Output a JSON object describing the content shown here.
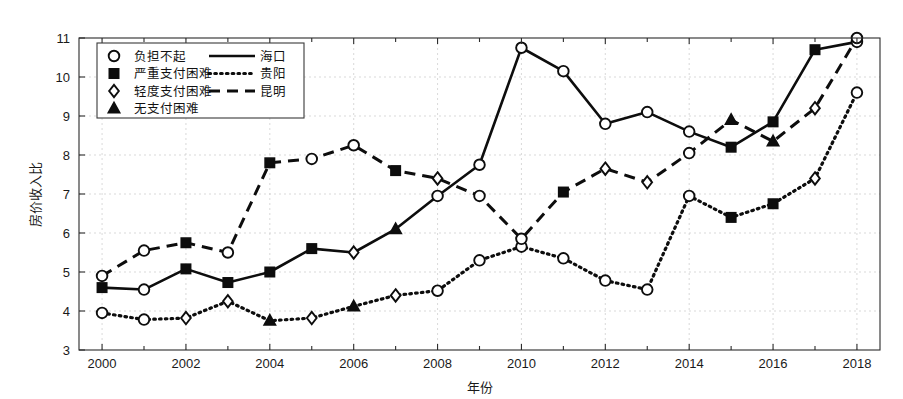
{
  "chart_data": {
    "type": "line",
    "title": "",
    "xlabel": "年份",
    "ylabel": "房价收入比",
    "xlim": [
      1999.45,
      2018.55
    ],
    "ylim": [
      3,
      11
    ],
    "xticks": [
      2000,
      2002,
      2004,
      2006,
      2008,
      2010,
      2012,
      2014,
      2016,
      2018
    ],
    "xtick_labels": [
      "2000",
      "2002",
      "2004",
      "2006",
      "2008",
      "2010",
      "2012",
      "2014",
      "2016",
      "2018"
    ],
    "xticks_minor": [
      2001,
      2003,
      2005,
      2007,
      2009,
      2011,
      2013,
      2015,
      2017
    ],
    "yticks": [
      3,
      4,
      5,
      6,
      7,
      8,
      9,
      10,
      11
    ],
    "ytick_labels": [
      "3",
      "4",
      "5",
      "6",
      "7",
      "8",
      "9",
      "10",
      "11"
    ],
    "grid": true,
    "legend_position": "upper-left",
    "x": [
      2000,
      2001,
      2002,
      2003,
      2004,
      2005,
      2006,
      2007,
      2008,
      2009,
      2010,
      2011,
      2012,
      2013,
      2014,
      2015,
      2016,
      2017,
      2018
    ],
    "series": [
      {
        "name": "海口",
        "line_style": "solid",
        "values": [
          4.6,
          4.55,
          5.08,
          4.73,
          5.0,
          5.6,
          5.5,
          6.1,
          6.95,
          7.75,
          10.75,
          10.15,
          8.8,
          9.1,
          8.6,
          8.2,
          8.85,
          10.7,
          10.9
        ],
        "marker_categories": [
          "严重支付困难",
          "负担不起",
          "严重支付困难",
          "严重支付困难",
          "严重支付困难",
          "严重支付困难",
          "轻度支付困难",
          "无支付困难",
          "负担不起",
          "负担不起",
          "负担不起",
          "负担不起",
          "负担不起",
          "负担不起",
          "负担不起",
          "严重支付困难",
          "严重支付困难",
          "严重支付困难",
          "负担不起"
        ]
      },
      {
        "name": "贵阳",
        "line_style": "dotted",
        "values": [
          3.95,
          3.78,
          3.82,
          4.25,
          3.75,
          3.82,
          4.12,
          4.4,
          4.52,
          5.3,
          5.65,
          5.35,
          4.78,
          4.55,
          6.95,
          6.4,
          6.75,
          7.4,
          9.6
        ],
        "marker_categories": [
          "负担不起",
          "负担不起",
          "轻度支付困难",
          "轻度支付困难",
          "无支付困难",
          "轻度支付困难",
          "无支付困难",
          "轻度支付困难",
          "负担不起",
          "负担不起",
          "负担不起",
          "负担不起",
          "负担不起",
          "负担不起",
          "负担不起",
          "严重支付困难",
          "严重支付困难",
          "轻度支付困难",
          "负担不起"
        ]
      },
      {
        "name": "昆明",
        "line_style": "dashed",
        "values": [
          4.9,
          5.55,
          5.75,
          5.5,
          7.8,
          7.9,
          8.25,
          7.6,
          7.4,
          6.95,
          5.85,
          7.05,
          7.65,
          7.3,
          8.05,
          8.9,
          8.35,
          9.2,
          11.0
        ],
        "marker_categories": [
          "负担不起",
          "负担不起",
          "严重支付困难",
          "负担不起",
          "严重支付困难",
          "负担不起",
          "负担不起",
          "严重支付困难",
          "轻度支付困难",
          "负担不起",
          "负担不起",
          "严重支付困难",
          "轻度支付困难",
          "轻度支付困难",
          "负担不起",
          "无支付困难",
          "无支付困难",
          "轻度支付困难",
          "负担不起"
        ]
      }
    ],
    "marker_legend": [
      {
        "marker": "circle",
        "label": "负担不起"
      },
      {
        "marker": "square",
        "label": "严重支付困难"
      },
      {
        "marker": "diamond",
        "label": "轻度支付困难"
      },
      {
        "marker": "triangle",
        "label": "无支付困难"
      }
    ],
    "line_legend": [
      {
        "line_style": "solid",
        "label": "海口"
      },
      {
        "line_style": "dotted",
        "label": "贵阳"
      },
      {
        "line_style": "dashed",
        "label": "昆明"
      }
    ],
    "colors": {
      "line": "#0d0d0d",
      "grid": "#c9c9c9",
      "axis": "#2b2b2b",
      "background": "#ffffff"
    }
  }
}
